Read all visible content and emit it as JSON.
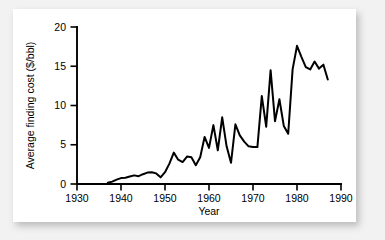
{
  "chart_data": {
    "type": "line",
    "title": "",
    "xlabel": "Year",
    "ylabel": "Average finding cost ($/bbl)",
    "xlim": [
      1930,
      1990
    ],
    "ylim": [
      0,
      20
    ],
    "xticks": [
      1930,
      1940,
      1950,
      1960,
      1970,
      1980,
      1990
    ],
    "xtick_labels": [
      "1930",
      "1940",
      "1950",
      "1960",
      "1970",
      "1980",
      "1990"
    ],
    "yticks": [
      0,
      5,
      10,
      15,
      20
    ],
    "ytick_labels": [
      "0",
      "5",
      "10",
      "15",
      "20"
    ],
    "grid": false,
    "legend": null,
    "line_color": "#000000",
    "series": [
      {
        "name": "Average finding cost",
        "x": [
          1937,
          1938,
          1939,
          1940,
          1941,
          1942,
          1943,
          1944,
          1945,
          1946,
          1947,
          1948,
          1949,
          1950,
          1951,
          1952,
          1953,
          1954,
          1955,
          1956,
          1957,
          1958,
          1959,
          1960,
          1961,
          1962,
          1963,
          1964,
          1965,
          1966,
          1967,
          1968,
          1969,
          1970,
          1971,
          1972,
          1973,
          1974,
          1975,
          1976,
          1977,
          1978,
          1979,
          1980,
          1981,
          1982,
          1983,
          1984,
          1985,
          1986,
          1987
        ],
        "values": [
          0.15,
          0.3,
          0.55,
          0.75,
          0.8,
          0.95,
          1.1,
          1.0,
          1.25,
          1.45,
          1.5,
          1.35,
          0.85,
          1.5,
          2.6,
          4.0,
          3.1,
          2.8,
          3.5,
          3.4,
          2.4,
          3.4,
          6.0,
          4.6,
          7.5,
          4.3,
          8.5,
          4.8,
          2.7,
          7.6,
          6.2,
          5.4,
          4.8,
          4.7,
          4.7,
          11.2,
          7.3,
          14.5,
          8.0,
          10.8,
          7.4,
          6.4,
          14.6,
          17.6,
          16.2,
          14.9,
          14.6,
          15.6,
          14.7,
          15.2,
          13.3
        ]
      }
    ]
  },
  "axes": {
    "x_title": "Year",
    "y_title": "Average finding cost ($/bbl)"
  }
}
